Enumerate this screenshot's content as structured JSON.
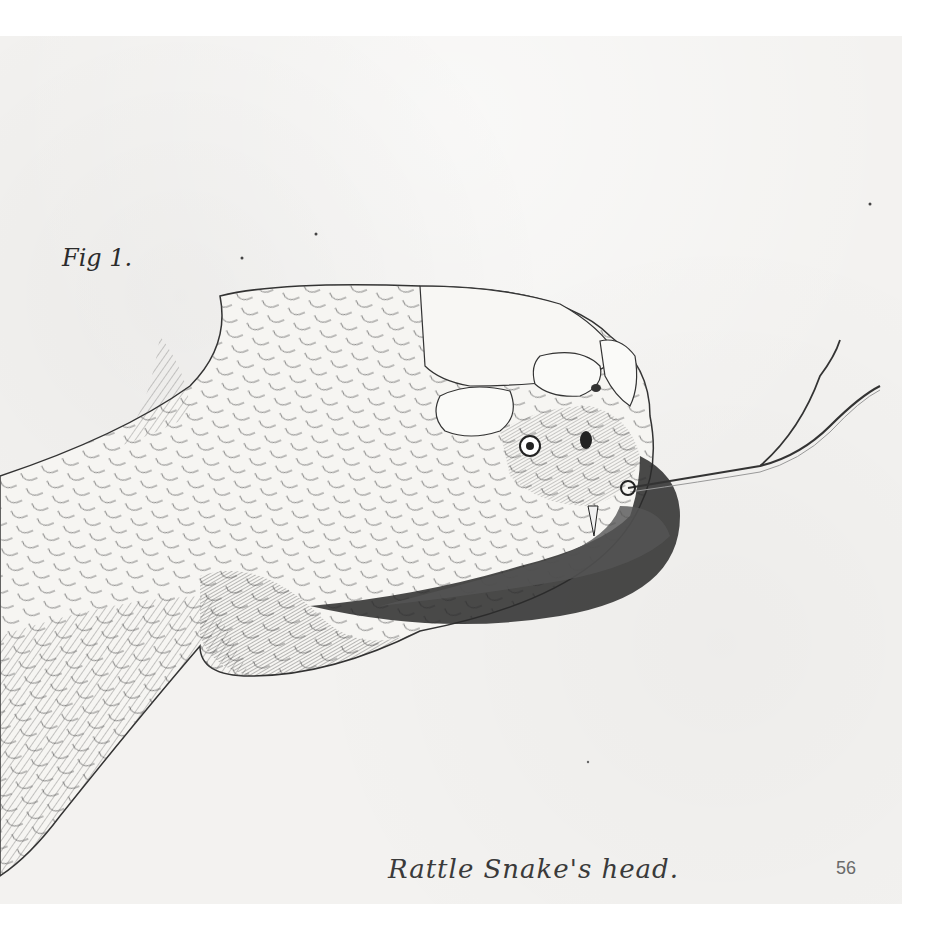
{
  "header": {
    "cropped_text": ""
  },
  "plate": {
    "figure_label": "Fig 1.",
    "caption": "Rattle Snake's head.",
    "page_number": "56",
    "subject": "rattlesnake head illustration, pen and ink hatching, tongue extended",
    "colors": {
      "paper": "#f3f2f0",
      "ink": "#2b2b2b",
      "background": "#ffffff"
    }
  }
}
